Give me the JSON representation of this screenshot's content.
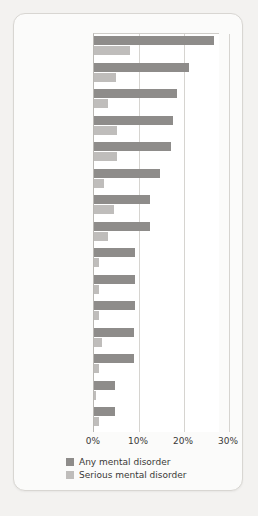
{
  "chart_data": {
    "type": "bar",
    "orientation": "horizontal",
    "title": "",
    "xlabel": "",
    "ylabel": "",
    "xlim": [
      0,
      30
    ],
    "xticks": [
      "0%",
      "10%",
      "20%",
      "30%"
    ],
    "xtick_values": [
      0,
      10,
      20,
      30
    ],
    "grid": true,
    "legend_position": "bottom",
    "categories": [
      "United States",
      "Ukraine",
      "France",
      "Colombia",
      "Lebanon",
      "Netherlands",
      "Mexico",
      "Belgium",
      "Spain",
      "Germany",
      "Beijing",
      "Japan",
      "Italy",
      "Nigeria",
      "Shanghai"
    ],
    "series": [
      {
        "name": "Any mental disorder",
        "color": "#8e8c8a",
        "values": [
          26.7,
          21.1,
          18.5,
          17.6,
          17.0,
          14.7,
          12.5,
          12.5,
          9.2,
          9.2,
          9.2,
          8.8,
          8.8,
          4.7,
          4.7
        ]
      },
      {
        "name": "Serious mental disorder",
        "color": "#bfbdbb",
        "values": [
          8.1,
          4.9,
          3.0,
          5.2,
          5.0,
          2.3,
          4.5,
          3.0,
          1.2,
          1.2,
          1.0,
          1.8,
          1.2,
          0.5,
          1.0
        ]
      }
    ]
  },
  "legend": {
    "items": [
      {
        "label": "Any mental disorder",
        "color": "#8e8c8a"
      },
      {
        "label": "Serious mental disorder",
        "color": "#bfbdbb"
      }
    ]
  }
}
